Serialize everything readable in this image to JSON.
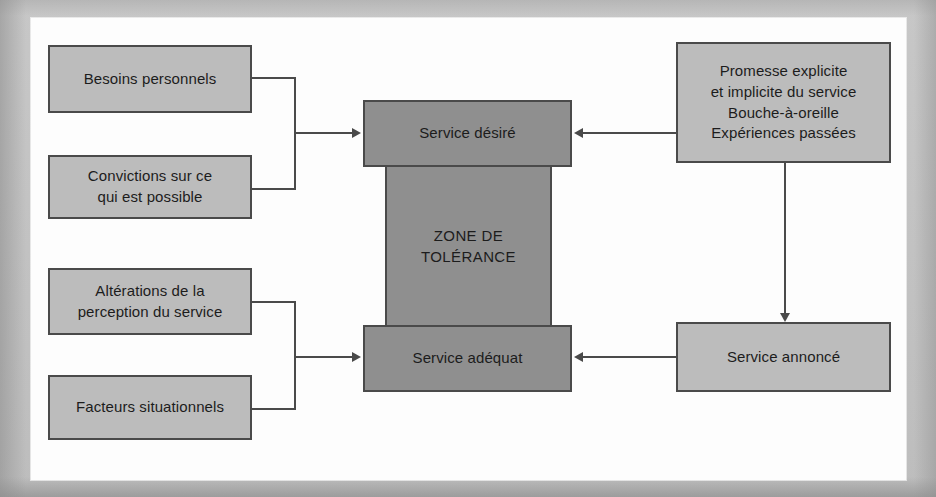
{
  "diagram": {
    "type": "flow-diagram",
    "colors": {
      "box_fill_light": "#bcbcbc",
      "box_fill_dark": "#8f8f8f",
      "stroke": "#4a4a4a",
      "page_background": "#fdfdfd",
      "scan_border": "#bdbdbd"
    },
    "nodes": {
      "besoins_personnels": {
        "label": "Besoins personnels"
      },
      "convictions": {
        "line1": "Convictions sur ce",
        "line2": "qui est possible"
      },
      "alterations": {
        "line1": "Altérations de la",
        "line2": "perception du service"
      },
      "facteurs": {
        "label": "Facteurs situationnels"
      },
      "service_desire": {
        "label": "Service désiré"
      },
      "zone_tolerance": {
        "line1": "ZONE DE",
        "line2": "TOLÉRANCE"
      },
      "service_adequat": {
        "label": "Service adéquat"
      },
      "promesse": {
        "line1": "Promesse explicite",
        "line2": "et implicite du service",
        "line3": "Bouche-à-oreille",
        "line4": "Expériences passées"
      },
      "service_annonce": {
        "label": "Service annoncé"
      }
    },
    "edges": [
      {
        "from": "besoins_personnels",
        "to": "service_desire",
        "style": "bracket-arrow-right"
      },
      {
        "from": "convictions",
        "to": "service_desire",
        "style": "bracket-arrow-right"
      },
      {
        "from": "alterations",
        "to": "service_adequat",
        "style": "bracket-arrow-right"
      },
      {
        "from": "facteurs",
        "to": "service_adequat",
        "style": "bracket-arrow-right"
      },
      {
        "from": "promesse",
        "to": "service_desire",
        "style": "arrow-left"
      },
      {
        "from": "promesse",
        "to": "service_annonce",
        "style": "arrow-down"
      },
      {
        "from": "service_annonce",
        "to": "service_adequat",
        "style": "arrow-left"
      }
    ]
  }
}
